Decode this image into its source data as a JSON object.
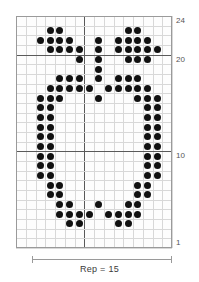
{
  "chart_data": {
    "type": "heatmap",
    "title": "",
    "subtitle": "",
    "xlabel": "",
    "ylabel": "",
    "grid": true,
    "legend_position": "none",
    "columns": 16,
    "rows": 24,
    "xlim": [
      1,
      16
    ],
    "ylim": [
      1,
      24
    ],
    "row_tick_labels": [
      "24",
      "20",
      "10",
      "1"
    ],
    "row_tick_values": [
      24,
      20,
      10,
      1
    ],
    "heavy_row_lines": [
      20,
      10
    ],
    "heavy_column_lines": [
      7
    ],
    "cell_symbol": "filled-dot",
    "filled_cells": [
      {
        "row": 23,
        "cols": [
          4,
          5,
          12,
          13
        ]
      },
      {
        "row": 22,
        "cols": [
          3,
          4,
          5,
          6,
          9,
          11,
          12,
          13,
          14
        ]
      },
      {
        "row": 21,
        "cols": [
          4,
          5,
          6,
          7,
          9,
          11,
          12,
          13,
          14,
          15
        ]
      },
      {
        "row": 20,
        "cols": [
          7,
          9,
          12,
          13,
          14
        ]
      },
      {
        "row": 19,
        "cols": [
          9
        ]
      },
      {
        "row": 18,
        "cols": [
          5,
          6,
          7,
          9,
          11,
          12,
          13
        ]
      },
      {
        "row": 17,
        "cols": [
          4,
          5,
          6,
          7,
          8,
          10,
          11,
          12,
          13,
          14
        ]
      },
      {
        "row": 16,
        "cols": [
          3,
          4,
          5,
          9,
          13,
          14,
          15
        ]
      },
      {
        "row": 15,
        "cols": [
          3,
          4,
          14,
          15
        ]
      },
      {
        "row": 14,
        "cols": [
          3,
          4,
          14,
          15
        ]
      },
      {
        "row": 13,
        "cols": [
          3,
          4,
          14,
          15
        ]
      },
      {
        "row": 12,
        "cols": [
          3,
          4,
          14,
          15
        ]
      },
      {
        "row": 11,
        "cols": [
          3,
          4,
          14,
          15
        ]
      },
      {
        "row": 10,
        "cols": [
          3,
          4,
          14,
          15
        ]
      },
      {
        "row": 9,
        "cols": [
          3,
          4,
          14,
          15
        ]
      },
      {
        "row": 8,
        "cols": [
          3,
          4,
          14,
          15
        ]
      },
      {
        "row": 7,
        "cols": [
          4,
          5,
          13,
          14
        ]
      },
      {
        "row": 6,
        "cols": [
          4,
          5,
          13,
          14
        ]
      },
      {
        "row": 5,
        "cols": [
          5,
          6,
          9,
          12,
          13
        ]
      },
      {
        "row": 4,
        "cols": [
          5,
          6,
          7,
          8,
          10,
          11,
          12,
          13
        ]
      },
      {
        "row": 3,
        "cols": [
          6,
          7,
          11,
          12
        ]
      },
      {
        "row": 2,
        "cols": []
      },
      {
        "row": 1,
        "cols": []
      },
      {
        "row": 24,
        "cols": []
      }
    ]
  },
  "axis": {
    "row_labels": [
      {
        "value": 24,
        "text": "24"
      },
      {
        "value": 20,
        "text": "20"
      },
      {
        "value": 10,
        "text": "10"
      },
      {
        "value": 1,
        "text": "1"
      }
    ]
  },
  "repeat": {
    "caption": "Rep = 15",
    "count": 15,
    "start_column": 2,
    "end_column": 16
  },
  "colors": {
    "dot": "#111111",
    "grid_light": "#d8d8d8",
    "grid_heavy": "#5a5a5a",
    "border": "#9a9a9a",
    "label": "#555555",
    "background": "#ffffff"
  }
}
